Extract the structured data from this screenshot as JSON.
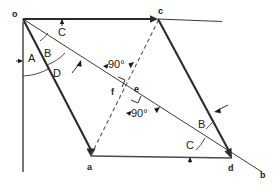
{
  "diagram": {
    "background_color": "#ffffff",
    "ink_color": "#2b2b2b",
    "points": [
      {
        "id": "o",
        "label": "o",
        "x": 23,
        "y": 19,
        "role": "origin"
      },
      {
        "id": "c",
        "label": "c",
        "x": 158,
        "y": 19,
        "role": "vertex"
      },
      {
        "id": "a",
        "label": "a",
        "x": 91,
        "y": 156,
        "role": "vertex"
      },
      {
        "id": "d",
        "label": "d",
        "x": 231,
        "y": 158,
        "role": "vertex"
      },
      {
        "id": "b",
        "label": "b",
        "x": 262,
        "y": 172,
        "role": "ray-end"
      },
      {
        "id": "e",
        "label": "e",
        "x": 137,
        "y": 89,
        "role": "intersection"
      },
      {
        "id": "f",
        "label": "f",
        "x": 114,
        "y": 90,
        "role": "intersection"
      }
    ],
    "segment_labels": [
      {
        "id": "A",
        "label": "A",
        "x": 31,
        "y": 58
      },
      {
        "id": "B1",
        "label": "B",
        "x": 47,
        "y": 53
      },
      {
        "id": "C1",
        "label": "C",
        "x": 62,
        "y": 32
      },
      {
        "id": "D",
        "label": "D",
        "x": 56,
        "y": 73
      },
      {
        "id": "B2",
        "label": "B",
        "x": 201,
        "y": 124
      },
      {
        "id": "C2",
        "label": "C",
        "x": 190,
        "y": 145
      }
    ],
    "angle_labels": [
      {
        "id": "ang-upper",
        "label": "90°",
        "x": 117,
        "y": 64
      },
      {
        "id": "ang-lower",
        "label": "90°",
        "x": 140,
        "y": 113
      }
    ],
    "lines": [
      {
        "id": "o-c-ray",
        "kind": "solid-heavy",
        "from": "o",
        "to": "c",
        "extends_to_x": 222,
        "arrow": "at-c"
      },
      {
        "id": "o-a",
        "kind": "solid-heavy",
        "from": "o",
        "to": "a",
        "arrow": "at-a"
      },
      {
        "id": "o-b-ray",
        "kind": "solid-thin",
        "from": "o",
        "to": "b",
        "arrow": "none"
      },
      {
        "id": "c-d",
        "kind": "solid-heavy",
        "from": "c",
        "to": "d",
        "arrow": "at-d"
      },
      {
        "id": "a-d",
        "kind": "solid-thin",
        "from": "a",
        "to": "d",
        "arrow": "none"
      },
      {
        "id": "a-c-dashed",
        "kind": "dashed",
        "from": "a",
        "to": "c",
        "arrow": "none"
      },
      {
        "id": "o-vertical",
        "kind": "solid-thin",
        "from": "o",
        "to": "o-down",
        "arrow": "none"
      }
    ],
    "tick_marks": [
      {
        "id": "tick-top",
        "on": "o-c-ray",
        "x": 62,
        "y": 19,
        "direction": "up"
      },
      {
        "id": "tick-left",
        "on": "o-vertical",
        "x": 23,
        "y": 61,
        "direction": "right"
      },
      {
        "id": "tick-bottom",
        "on": "a-d",
        "x": 190,
        "y": 157,
        "direction": "up"
      },
      {
        "id": "tick-cd",
        "on": "c-d",
        "x": 215,
        "y": 112,
        "direction": "left"
      },
      {
        "id": "tick-ob",
        "on": "o-b-ray",
        "x": 79,
        "y": 60,
        "direction": "up-right"
      }
    ],
    "arcs": [
      {
        "id": "arc-A",
        "center": "o",
        "label_ref": "A"
      },
      {
        "id": "arc-D",
        "center": "o",
        "label_ref": "D"
      },
      {
        "id": "arc-B1",
        "center": "o",
        "label_ref": "B1"
      },
      {
        "id": "arc-C2",
        "center": "d",
        "label_ref": "C2"
      },
      {
        "id": "arc-B2",
        "center": "d",
        "label_ref": "B2"
      }
    ]
  }
}
